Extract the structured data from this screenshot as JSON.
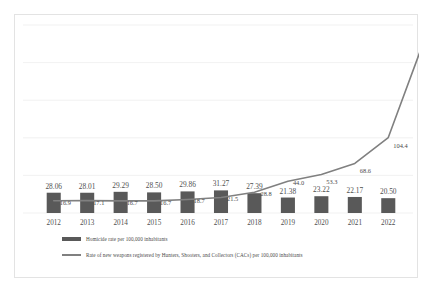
{
  "chart_data": {
    "type": "bar",
    "title": "",
    "xlabel": "",
    "ylabel": "",
    "grid": true,
    "legend_position": "bottom-left",
    "categories": [
      "2012",
      "2013",
      "2014",
      "2015",
      "2016",
      "2017",
      "2018",
      "2019",
      "2020",
      "2021",
      "2022"
    ],
    "ylim": [
      0,
      260
    ],
    "series": [
      {
        "name": "Homicide rate per 100,000 inhabitants",
        "type": "bar",
        "color": "#595959",
        "values": [
          28.06,
          28.01,
          29.29,
          28.5,
          29.86,
          31.27,
          27.39,
          21.38,
          23.22,
          22.17,
          20.5
        ],
        "labels": [
          "28.06",
          "28.01",
          "29.29",
          "28.50",
          "29.86",
          "31.27",
          "27.39",
          "21.38",
          "23.22",
          "22.17",
          "20.50"
        ]
      },
      {
        "name": "Rate of new weapons registered by Hunters, Shooters, and Collectors (CACs) per 100,000 inhabitants",
        "type": "line",
        "color": "#808080",
        "values": [
          16.9,
          17.1,
          16.7,
          16.7,
          18.7,
          21.5,
          28.8,
          44.0,
          53.3,
          68.6,
          104.4
        ],
        "labels": [
          "16.9",
          "17.1",
          "16.7",
          "16.7",
          "18.7",
          "21.5",
          "28.8",
          "44.0",
          "53.3",
          "68.6",
          "104.4"
        ]
      }
    ],
    "extra_line_point": {
      "label": "229.59",
      "value": 229.59
    }
  },
  "legend": {
    "items": [
      {
        "marker": "bar-swatch",
        "label": "Homicide rate per 100,000 inhabitants"
      },
      {
        "marker": "line-swatch",
        "label": "Rate of new weapons registered by Hunters, Shooters, and Collectors (CACs) per 100,000 inhabitants"
      }
    ]
  }
}
